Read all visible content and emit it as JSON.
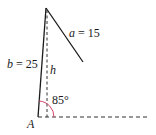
{
  "diagram": {
    "type": "triangle-ambiguous-case",
    "labels": {
      "side_a_var": "a",
      "side_a_eq": " = 15",
      "side_b_var": "b",
      "side_b_eq": " = 25",
      "height": "h",
      "angle": "85°",
      "vertex": "A"
    },
    "values": {
      "a": 15,
      "b": 25,
      "angle_A_deg": 85
    },
    "colors": {
      "lines": "#1a1a1a",
      "dashed": "#333333",
      "angle_arc": "#d9446a"
    }
  }
}
